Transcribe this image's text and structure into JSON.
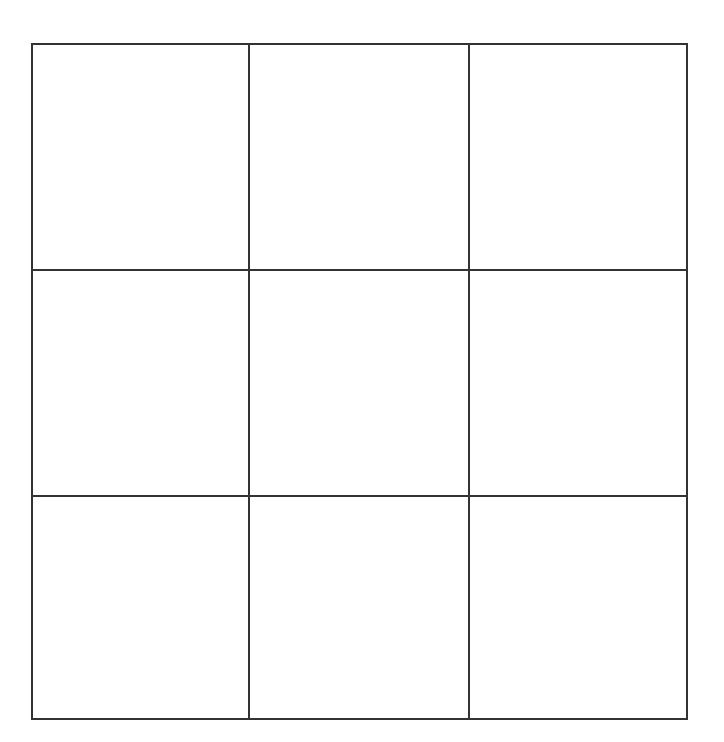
{
  "game": {
    "type": "tic-tac-toe",
    "line_color": "#333333",
    "background": "#ffffff"
  },
  "board": {
    "rows": 3,
    "cols": 3,
    "cells": [
      {
        "row": 1,
        "col": 1,
        "mark": ""
      },
      {
        "row": 1,
        "col": 2,
        "mark": ""
      },
      {
        "row": 1,
        "col": 3,
        "mark": ""
      },
      {
        "row": 2,
        "col": 1,
        "mark": ""
      },
      {
        "row": 2,
        "col": 2,
        "mark": ""
      },
      {
        "row": 2,
        "col": 3,
        "mark": ""
      },
      {
        "row": 3,
        "col": 1,
        "mark": ""
      },
      {
        "row": 3,
        "col": 2,
        "mark": ""
      },
      {
        "row": 3,
        "col": 3,
        "mark": ""
      }
    ]
  }
}
